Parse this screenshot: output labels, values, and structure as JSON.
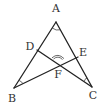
{
  "figure": {
    "type": "geometry-diagram",
    "colors": {
      "line": "#222222",
      "arc": "#444444",
      "label": "#333333",
      "background": "#ffffff"
    },
    "points": {
      "A": {
        "label": "A",
        "x": 56,
        "y": 22,
        "label_x": 56,
        "label_y": 9
      },
      "B": {
        "label": "B",
        "x": 14,
        "y": 88,
        "label_x": 12,
        "label_y": 99
      },
      "C": {
        "label": "C",
        "x": 92,
        "y": 87,
        "label_x": 93,
        "label_y": 96
      },
      "D": {
        "label": "D",
        "x": 37,
        "y": 50,
        "label_x": 30,
        "label_y": 47
      },
      "E": {
        "label": "E",
        "x": 78,
        "y": 57,
        "label_x": 83,
        "label_y": 53
      },
      "F": {
        "label": "F",
        "x": 58,
        "y": 62,
        "label_x": 58,
        "label_y": 75
      }
    },
    "segments": [
      {
        "from": "A",
        "to": "B"
      },
      {
        "from": "A",
        "to": "C"
      },
      {
        "from": "B",
        "to": "E"
      },
      {
        "from": "C",
        "to": "D"
      }
    ],
    "angle_marks": [
      {
        "vertex": "A",
        "arcs": 1
      },
      {
        "vertex": "B",
        "arcs": 1
      },
      {
        "vertex": "C",
        "arcs": 1
      },
      {
        "vertex": "F",
        "arcs": 2
      }
    ]
  }
}
